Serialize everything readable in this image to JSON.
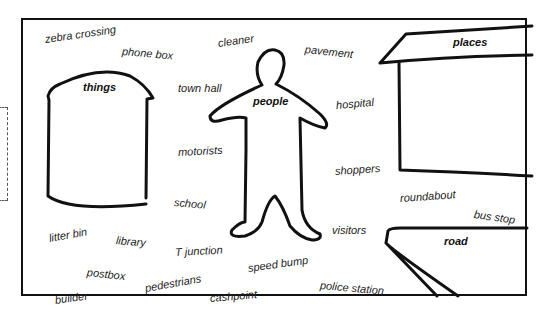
{
  "worksheet": {
    "categories": {
      "things": "things",
      "people": "people",
      "places": "places",
      "road": "road"
    },
    "words": [
      {
        "text": "zebra crossing"
      },
      {
        "text": "phone box"
      },
      {
        "text": "cleaner"
      },
      {
        "text": "pavement"
      },
      {
        "text": "town hall"
      },
      {
        "text": "hospital"
      },
      {
        "text": "motorists"
      },
      {
        "text": "shoppers"
      },
      {
        "text": "school"
      },
      {
        "text": "roundabout"
      },
      {
        "text": "bus stop"
      },
      {
        "text": "litter bin"
      },
      {
        "text": "library"
      },
      {
        "text": "T junction"
      },
      {
        "text": "visitors"
      },
      {
        "text": "speed bump"
      },
      {
        "text": "postbox"
      },
      {
        "text": "pedestrians"
      },
      {
        "text": "police station"
      },
      {
        "text": "builder"
      },
      {
        "text": "cashpoint"
      }
    ]
  }
}
